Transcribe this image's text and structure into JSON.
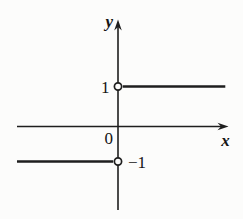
{
  "figure": {
    "background_color": "#fcfcfb",
    "line_color": "#1e1e1e",
    "text_color": "#141414"
  },
  "chart_data": {
    "type": "line",
    "subtype": "step-function",
    "title": "",
    "xlabel": "x",
    "ylabel": "y",
    "origin_label": "0",
    "y_tick_labels": [
      "1",
      "−1"
    ],
    "xlim": [
      -2.73,
      3.0
    ],
    "ylim": [
      -2.3,
      2.9
    ],
    "grid": false,
    "axes_arrows": true,
    "series": [
      {
        "name": "y = 1 for x > 0",
        "y": 1,
        "x_start": 0,
        "x_end": 2.9,
        "open_point": [
          0,
          1
        ]
      },
      {
        "name": "y = -1 for x < 0",
        "y": -1,
        "x_start": -2.73,
        "x_end": 0,
        "open_point": [
          0,
          -1
        ]
      }
    ]
  }
}
